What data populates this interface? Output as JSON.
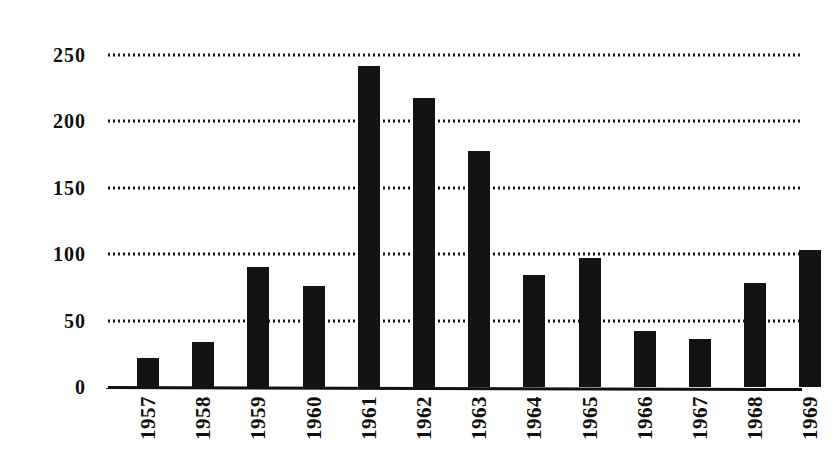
{
  "chart_data": {
    "type": "bar",
    "title": "",
    "subtitle": "",
    "xlabel": "",
    "ylabel": "",
    "categories": [
      "1957",
      "1958",
      "1959",
      "1960",
      "1961",
      "1962",
      "1963",
      "1964",
      "1965",
      "1966",
      "1967",
      "1968",
      "1969"
    ],
    "values": [
      22,
      34,
      90,
      76,
      242,
      218,
      178,
      84,
      97,
      42,
      36,
      78,
      103
    ],
    "series": [
      {
        "name": "",
        "values": [
          22,
          34,
          90,
          76,
          242,
          218,
          178,
          84,
          97,
          42,
          36,
          78,
          103
        ]
      }
    ],
    "ylim": [
      0,
      262
    ],
    "yticks": [
      0,
      50,
      100,
      150,
      200,
      250
    ],
    "ytick_labels": [
      "0",
      "50",
      "100",
      "150",
      "200",
      "250"
    ],
    "xtick_labels": [
      "1957",
      "1958",
      "1959",
      "1960",
      "1961",
      "1962",
      "1963",
      "1964",
      "1965",
      "1966",
      "1967",
      "1968",
      "1969"
    ],
    "grid": "horizontal-dotted",
    "legend": "none",
    "bar_color": "#151311",
    "grid_color": "#181614",
    "axis_color": "#141210",
    "background_color": "#ffffff",
    "annotations": []
  }
}
